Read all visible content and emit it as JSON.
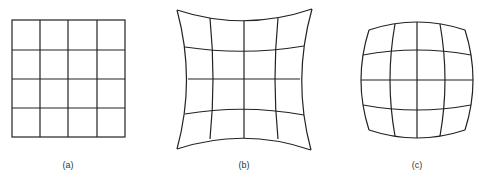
{
  "figure": {
    "panels": [
      {
        "id": "a",
        "label": "(a)",
        "description": "undistorted square grid (4x4 cells)",
        "label_x": 68
      },
      {
        "id": "b",
        "label": "(b)",
        "description": "pincushion distortion grid (4x4 cells)",
        "label_x": 244
      },
      {
        "id": "c",
        "label": "(c)",
        "description": "barrel distortion grid (4x4 cells)",
        "label_x": 417
      }
    ],
    "stroke_color": "#222222"
  }
}
